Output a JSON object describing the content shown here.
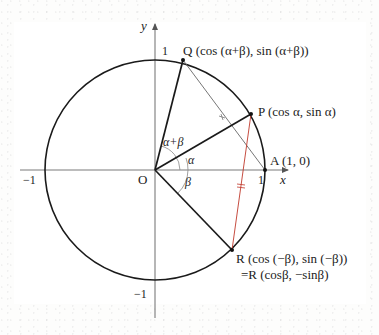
{
  "figure": {
    "type": "unit-circle-angle-addition-diagram",
    "axes": {
      "x_label": "x",
      "y_label": "y",
      "origin_label": "O",
      "ticks": {
        "x_pos": "1",
        "x_neg": "−1",
        "y_pos": "1",
        "y_neg": "−1"
      }
    },
    "points": {
      "Q": "Q (cos (α+β), sin (α+β))",
      "P": "P (cos α, sin α)",
      "A": "A (1, 0)",
      "R_line1": "R (cos (−β), sin (−β))",
      "R_line2": "=R (cosβ, −sinβ)"
    },
    "angles": {
      "alpha_plus_beta": "α+β",
      "alpha": "α",
      "beta": "β"
    },
    "colors": {
      "stroke": "#1a1a1a",
      "axis": "#777777",
      "chord_qa": "#666666",
      "chord_pr": "#c0392b",
      "background": "#ffffff"
    }
  }
}
